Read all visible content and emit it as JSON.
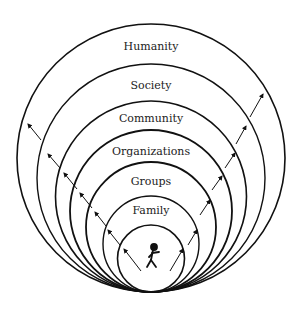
{
  "diagram": {
    "type": "nested tangent circles",
    "center_x": 151,
    "bottom_y": 292,
    "rings": [
      {
        "label": "Humanity",
        "radius": 134,
        "stroke": 1.6,
        "label_y": 50
      },
      {
        "label": "Society",
        "radius": 114,
        "stroke": 1.4,
        "label_y": 89
      },
      {
        "label": "Community",
        "radius": 95.5,
        "stroke": 1.6,
        "label_y": 122
      },
      {
        "label": "Organizations",
        "radius": 81,
        "stroke": 1.8,
        "label_y": 155
      },
      {
        "label": "Groups",
        "radius": 65,
        "stroke": 1.8,
        "label_y": 185
      },
      {
        "label": "Family",
        "radius": 48,
        "stroke": 1.4,
        "label_y": 214
      },
      {
        "label": "",
        "radius": 33.5,
        "stroke": 1.6,
        "label_y": 0
      }
    ],
    "center_figure": "stick-figure-person",
    "arrow_color": "#111111",
    "line_color": "#111111",
    "background": "#ffffff"
  }
}
